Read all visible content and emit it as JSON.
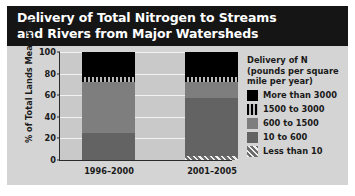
{
  "title": {
    "line1": "Delivery of Total Nitrogen to Streams",
    "line2": "and Rivers from Major Watersheds"
  },
  "legend": {
    "title_line1": "Delivery of N",
    "title_line2": "(pounds per square",
    "title_line3": "mile per year)",
    "items": [
      {
        "label": "More than 3000",
        "swatch": "solid-black-swatch",
        "color": "#000000"
      },
      {
        "label": "1500 to 3000",
        "swatch": "vertical-stripe-swatch",
        "color": "#000000"
      },
      {
        "label": "600 to 1500",
        "swatch": "medium-gray-swatch",
        "color": "#7e7e7e"
      },
      {
        "label": "10 to 600",
        "swatch": "dark-gray-swatch",
        "color": "#636363"
      },
      {
        "label": "Less than 10",
        "swatch": "diagonal-hatch-swatch",
        "color": "#9a9a9a"
      }
    ]
  },
  "chart_data": {
    "type": "bar",
    "subtype": "stacked-bar",
    "title": "Delivery of Total Nitrogen to Streams and Rivers from Major Watersheds",
    "xlabel": "",
    "ylabel": "% of Total Lands Measured",
    "ylim": [
      0,
      100
    ],
    "yticks": [
      0,
      20,
      40,
      60,
      80,
      100
    ],
    "grid": true,
    "legend_position": "right",
    "legend_title": "Delivery of N (pounds per square mile per year)",
    "categories": [
      "1996–2000",
      "2001–2005"
    ],
    "series": [
      {
        "name": "Less than 10",
        "values": [
          0,
          4
        ]
      },
      {
        "name": "10 to 600",
        "values": [
          25,
          53
        ]
      },
      {
        "name": "600 to 1500",
        "values": [
          47,
          15
        ]
      },
      {
        "name": "1500 to 3000",
        "values": [
          5,
          5
        ]
      },
      {
        "name": "More than 3000",
        "values": [
          23,
          23
        ]
      }
    ]
  }
}
